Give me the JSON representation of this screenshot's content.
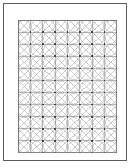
{
  "page": {
    "background_color": "#ffffff",
    "frame_color": "#5a5a5a",
    "width": 131,
    "height": 168
  },
  "pattern": {
    "name": "quilt-grid-pattern",
    "columns": 8,
    "rows": 11,
    "cell_width": 12.375,
    "cell_height": 12.09,
    "origin_x": 14,
    "origin_y": 16,
    "block_width": 99,
    "block_height": 133,
    "motifs": [
      "square-grid",
      "both-diagonals",
      "inscribed-circle",
      "intersection-dot"
    ],
    "grid_line_color": "#8a8a8a",
    "diagonal_line_color": "#9a9a9a",
    "circle_color": "#a8a8a8",
    "dot_color": "#404040",
    "dot_size": 1.6,
    "circle_radius_ratio": 0.46
  }
}
